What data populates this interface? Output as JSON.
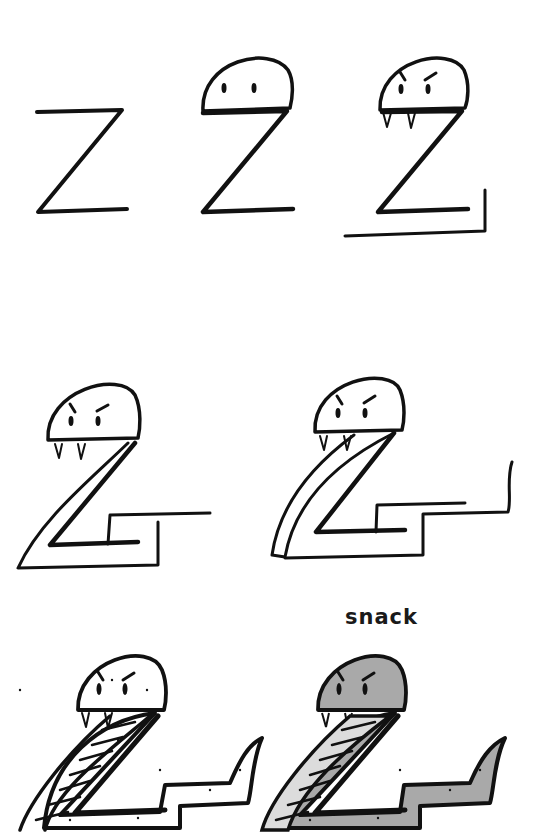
{
  "steps": [
    {
      "step": 1,
      "description": "Letter Z"
    },
    {
      "step": 2,
      "description": "Z with dome head and two eyes"
    },
    {
      "step": 3,
      "description": "Angry brows, fangs, tail base line"
    },
    {
      "step": 4,
      "description": "Outline body thickness"
    },
    {
      "step": 5,
      "description": "Add belly stripe and tail curl"
    },
    {
      "step": 6,
      "description": "Belly scales, spots and pointed tail"
    },
    {
      "step": 7,
      "description": "Colored finished snake"
    }
  ],
  "caption": "snack",
  "colors": {
    "ink": "#111111",
    "body_fill": "#a9a9a9",
    "belly_fill": "#dcdcdc",
    "background": "#ffffff"
  }
}
